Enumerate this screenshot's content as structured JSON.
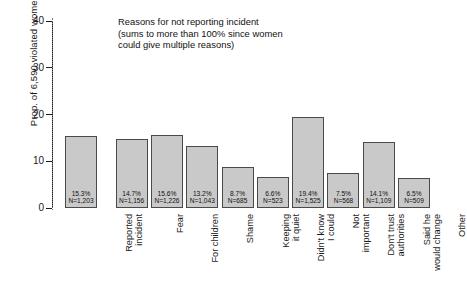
{
  "chart_data": {
    "type": "bar",
    "title": "",
    "xlabel": "",
    "ylabel": "Prop. of 6,590 violated women",
    "ylim": [
      0,
      40
    ],
    "yticks": [
      0,
      10,
      20,
      30,
      40
    ],
    "grid": false,
    "legend": false,
    "annotation": "Reasons for not reporting incident\n(sums to more than 100% since women\ncould give multiple reasons)",
    "categories": [
      "Reported\nincident",
      "Fear",
      "For children",
      "Shame",
      "Keeping\nit quiet",
      "Didn't know\nI could",
      "Not\nimportant",
      "Don't trust\nauthorities",
      "Said he\nwould change",
      "Other"
    ],
    "values": [
      15.3,
      14.7,
      15.6,
      13.2,
      8.7,
      6.6,
      19.4,
      7.5,
      14.1,
      6.5
    ],
    "counts": [
      1203,
      1156,
      1226,
      1043,
      685,
      523,
      1525,
      568,
      1109,
      509
    ],
    "bar_labels": [
      {
        "pct": "15.3%",
        "n": "N=1,203"
      },
      {
        "pct": "14.7%",
        "n": "N=1,156"
      },
      {
        "pct": "15.6%",
        "n": "N=1,226"
      },
      {
        "pct": "13.2%",
        "n": "N=1,043"
      },
      {
        "pct": "8.7%",
        "n": "N=685"
      },
      {
        "pct": "6.6%",
        "n": "N=523"
      },
      {
        "pct": "19.4%",
        "n": "N=1,525"
      },
      {
        "pct": "7.5%",
        "n": "N=568"
      },
      {
        "pct": "14.1%",
        "n": "N=1,109"
      },
      {
        "pct": "6.5%",
        "n": "N=509"
      }
    ],
    "colors": {
      "bar_fill": "#c9c9c9",
      "bar_edge": "#4a4a4a",
      "axis": "#1d1d1d",
      "text": "#111111",
      "divider": "#777777",
      "background": "#ffffff"
    }
  }
}
